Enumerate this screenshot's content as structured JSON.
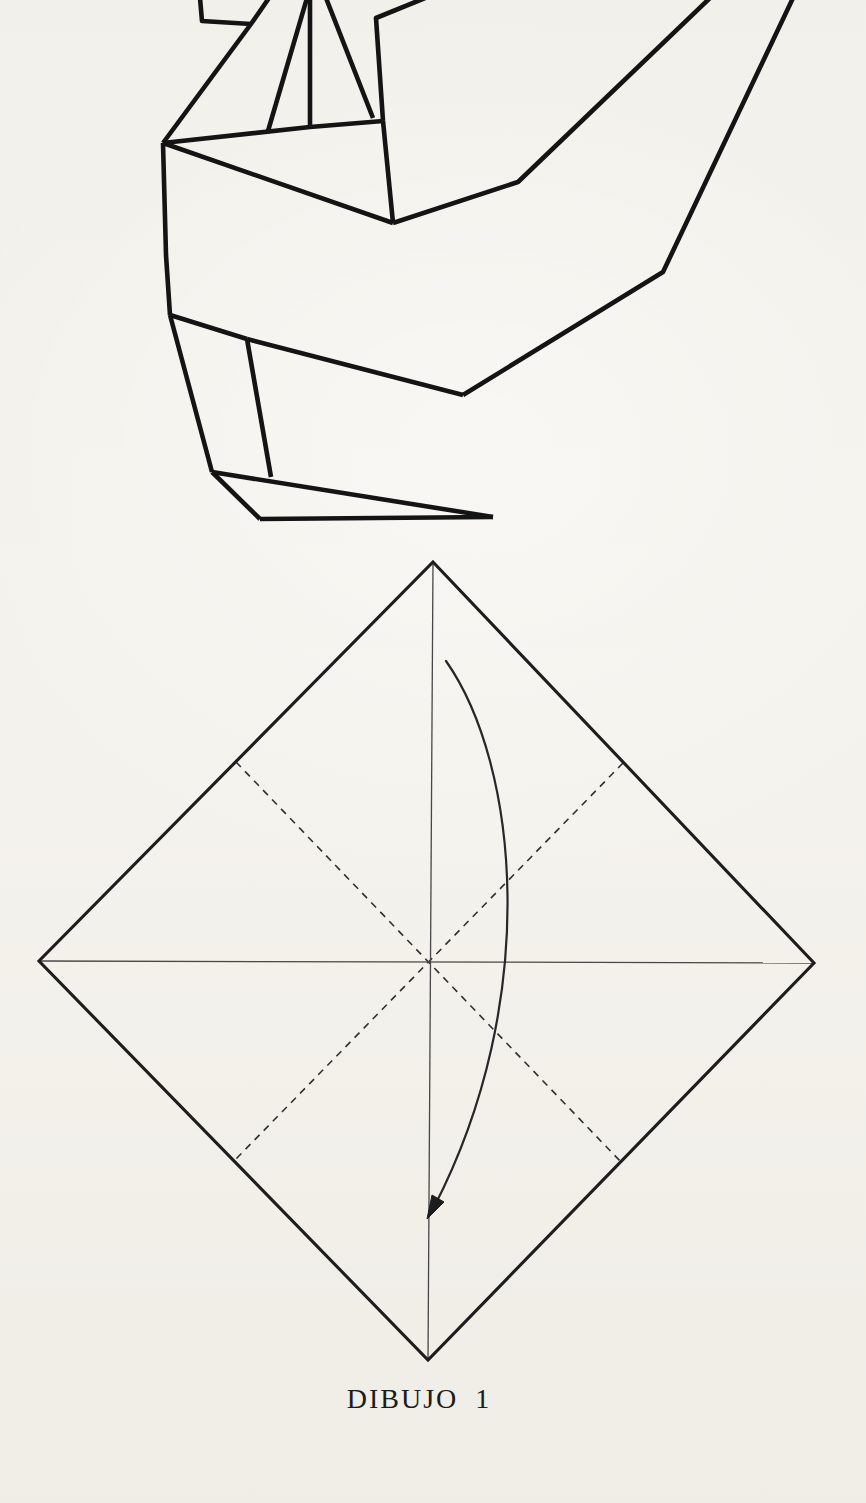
{
  "page": {
    "background_color": "#f2f0ea",
    "ink_color": "#141414"
  },
  "caption": {
    "text": "DIBUJO 1"
  },
  "figure1": {
    "label": "origami-model-line-drawing",
    "stroke": "#141414",
    "stroke_width": 4.6,
    "polylines": [
      [
        [
          200,
          -2
        ],
        [
          202,
          21
        ],
        [
          251,
          24
        ]
      ],
      [
        [
          269,
          -2
        ],
        [
          251,
          24
        ],
        [
          163,
          143
        ]
      ],
      [
        [
          307,
          -2
        ],
        [
          268,
          131
        ]
      ],
      [
        [
          310,
          -2
        ],
        [
          310,
          127
        ]
      ],
      [
        [
          326,
          -2
        ],
        [
          373,
          118
        ]
      ],
      [
        [
          425,
          -2
        ],
        [
          376,
          18
        ],
        [
          383,
          121
        ]
      ],
      [
        [
          163,
          143
        ],
        [
          310,
          127
        ],
        [
          383,
          121
        ]
      ],
      [
        [
          383,
          121
        ],
        [
          393,
          223
        ]
      ],
      [
        [
          163,
          143
        ],
        [
          393,
          223
        ]
      ],
      [
        [
          393,
          223
        ],
        [
          518,
          182
        ],
        [
          710,
          -2
        ]
      ],
      [
        [
          793,
          -2
        ],
        [
          663,
          272
        ],
        [
          463,
          395
        ]
      ],
      [
        [
          463,
          395
        ],
        [
          247,
          339
        ]
      ],
      [
        [
          163,
          143
        ],
        [
          166,
          255
        ],
        [
          170,
          315
        ]
      ],
      [
        [
          170,
          315
        ],
        [
          212,
          472
        ]
      ],
      [
        [
          170,
          315
        ],
        [
          247,
          339
        ]
      ],
      [
        [
          247,
          339
        ],
        [
          271,
          477
        ]
      ],
      [
        [
          212,
          472
        ],
        [
          260,
          519
        ]
      ],
      [
        [
          212,
          472
        ],
        [
          493,
          517
        ]
      ],
      [
        [
          260,
          519
        ],
        [
          493,
          517
        ]
      ]
    ]
  },
  "figure2": {
    "label": "fold-step-diagram",
    "outline_points": [
      [
        433,
        562
      ],
      [
        814,
        963
      ],
      [
        428,
        1360
      ],
      [
        39,
        961
      ]
    ],
    "outline_stroke": "#1d1d1d",
    "outline_width": 3.1,
    "thin_stroke": "#474747",
    "thin_width": 1.3,
    "thin_lines": [
      [
        [
          433,
          562
        ],
        [
          428,
          1360
        ]
      ],
      [
        [
          39,
          961
        ],
        [
          814,
          963
        ]
      ]
    ],
    "dash_stroke": "#2f2f2f",
    "dash_width": 1.6,
    "dash_pattern": "7 6",
    "dashed_lines": [
      [
        [
          236,
          762
        ],
        [
          621,
          1162
        ]
      ],
      [
        [
          623,
          763
        ],
        [
          234,
          1161
        ]
      ]
    ],
    "arrow_stroke": "#272727",
    "arrow_width": 2.2,
    "arrow_path": "M446,661 C519,765 541,1000 434,1207",
    "arrow_head": [
      [
        427,
        1219
      ],
      [
        444,
        1202
      ],
      [
        432,
        1195
      ]
    ]
  }
}
